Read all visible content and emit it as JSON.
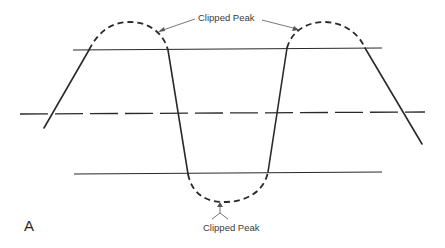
{
  "diagram": {
    "panel_label": "A",
    "top_annotation": "Clipped Peak",
    "bottom_annotation": "Clipped Peak",
    "elements": {
      "upper_clip_line": "solid horizontal line",
      "center_axis": "long-dash horizontal line",
      "lower_clip_line": "solid horizontal line",
      "waveform": "solid sloped segments",
      "clipped_peaks": "dashed arcs above upper and below lower clip lines"
    },
    "colors": {
      "line": "#2a2a2a",
      "annotation": "#3a3a3a",
      "background": "#ffffff"
    }
  }
}
